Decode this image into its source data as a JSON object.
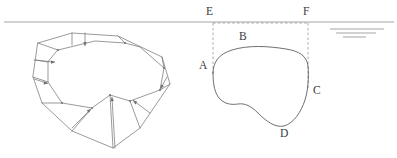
{
  "figure": {
    "background_color": "#ffffff",
    "line_color": "#6e6e74",
    "curve_color": "#55555c",
    "water_color": "#8e8e96",
    "dash_color": "#9a9aa2",
    "label_color": "#3b3b42",
    "width": 397,
    "height": 158
  },
  "waterline": {
    "name": "water-surface-line",
    "y": 22,
    "x_start": 4,
    "x_end": 394,
    "symbol_lines": [
      {
        "x1": 330,
        "x2": 384,
        "y": 29
      },
      {
        "x1": 336,
        "x2": 376,
        "y": 33
      },
      {
        "x1": 343,
        "x2": 366,
        "y": 37
      }
    ]
  },
  "left_solid": {
    "name": "three-dimensional-solid",
    "description": "Faceted prism with outer polygon rim, inner rounded cross-section and inward normal arrows",
    "outer_polygon": "38,43 72,33 118,36 162,57 170,84 140,128 113,148 72,131 42,103 33,77",
    "inner_blob": "58,50 95,41 140,47 164,68 160,90 130,101 110,95 92,108 62,103 48,82 48,62",
    "connector_edges": [
      "38,43 58,50",
      "72,33 72,45",
      "118,36 125,43",
      "162,57 164,68",
      "170,84 160,90",
      "140,128 130,101",
      "113,148 110,95",
      "72,131 92,108",
      "42,103 62,103",
      "33,77 48,82"
    ],
    "facet_lines": [
      "58,50 48,62",
      "48,62 48,82",
      "48,82 62,103",
      "125,43 140,47"
    ],
    "arrows": [
      {
        "from": "40,45",
        "to": "56,51"
      },
      {
        "from": "36,78",
        "to": "47,82"
      },
      {
        "from": "42,62",
        "to": "47,63"
      },
      {
        "from": "84,36",
        "to": "86,44"
      },
      {
        "from": "116,152",
        "to": "111,98"
      },
      {
        "from": "150,112",
        "to": "136,99"
      },
      {
        "from": "164,80",
        "to": "161,88"
      }
    ]
  },
  "cross_section": {
    "name": "cross-section-diagram",
    "outline_points": "213,73 216,59 228,50 250,46 275,47 295,51 306,57 309,70 308,85 306,98 300,112 293,122 283,126 271,124 261,116 251,107 242,104 232,106 224,104 217,97 213,86",
    "bounding_box": {
      "left_x": 213,
      "right_x": 308,
      "top_y": 22,
      "bottom_y": 104
    },
    "labels": [
      {
        "id": "A",
        "text": "A",
        "x": 200,
        "y": 66,
        "name": "label-a"
      },
      {
        "id": "B",
        "text": "B",
        "x": 240,
        "y": 36,
        "name": "label-b"
      },
      {
        "id": "C",
        "text": "C",
        "x": 313,
        "y": 90,
        "name": "label-c"
      },
      {
        "id": "D",
        "text": "D",
        "x": 281,
        "y": 130,
        "name": "label-d"
      },
      {
        "id": "E",
        "text": "E",
        "x": 205,
        "y": 8,
        "name": "label-e"
      },
      {
        "id": "F",
        "text": "F",
        "x": 303,
        "y": 8,
        "name": "label-f"
      }
    ]
  }
}
